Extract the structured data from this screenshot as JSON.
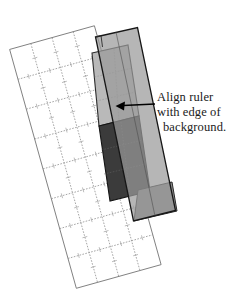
{
  "figure": {
    "callout": {
      "line1": "Align ruler",
      "line2": "with edge of",
      "line3": "background.",
      "arrow_label": "arrow pointing to ruler edge"
    },
    "colors": {
      "page_background": "#ffffff",
      "grid_line": "#7d7d7d",
      "ruler_fill": "#9a9a9a",
      "ruler_stroke": "#1c1c1c",
      "light_patch_fill": "#b9b9b9",
      "light_patch_stroke": "#2a2a2a",
      "dark_patch_fill": "#3b3b3b",
      "dark_patch_stroke": "#151515",
      "mid_patch_fill": "#8d8d8d",
      "text": "#1a1a1a",
      "arrow": "#000000"
    },
    "elements": {
      "grid_name": "cutting-mat-grid",
      "grid_rows": 8,
      "grid_cols": 4,
      "grid_rotation_deg": -15,
      "ruler_name": "transparent-ruler",
      "ruler_rotation_deg": -8,
      "light_patch_name": "light-fabric-piece",
      "dark_patch_name": "dark-fabric-piece",
      "mid_patch_name": "medium-fabric-piece"
    }
  }
}
